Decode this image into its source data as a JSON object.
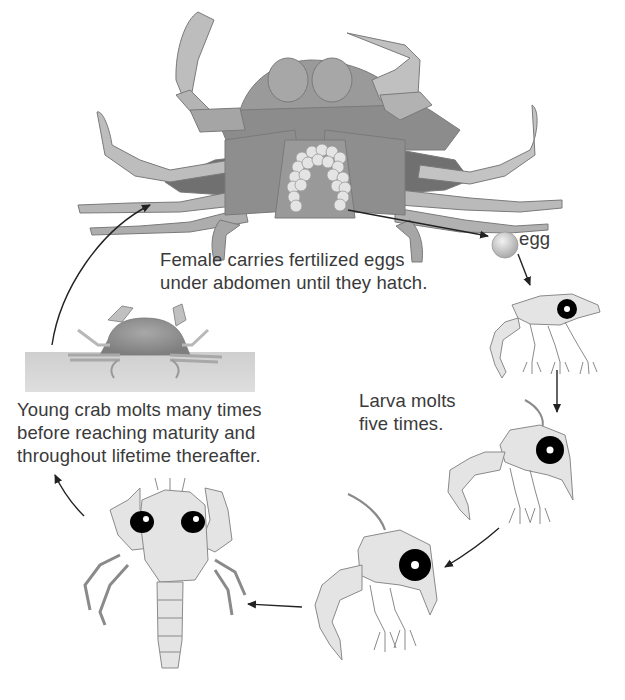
{
  "diagram": {
    "stages": [
      {
        "id": "adult-female",
        "name": "Adult female crab with eggs"
      },
      {
        "id": "egg",
        "name": "egg"
      },
      {
        "id": "larva-1",
        "name": "Larva (zoea), early stage"
      },
      {
        "id": "larva-2",
        "name": "Larva (zoea), later stage"
      },
      {
        "id": "larva-3",
        "name": "Larva (zoea), final stage"
      },
      {
        "id": "megalopa",
        "name": "Postlarva (megalopa)"
      },
      {
        "id": "young-crab",
        "name": "Young crab on sea floor"
      }
    ],
    "labels": {
      "female": [
        "Female carries fertilized eggs",
        "under abdomen until they hatch."
      ],
      "egg": "egg",
      "larva": [
        "Larva molts",
        "five times."
      ],
      "young": [
        "Young crab molts many times",
        "before reaching maturity and",
        "throughout lifetime thereafter."
      ]
    },
    "colors": {
      "crab_body": "#8f8f8f",
      "crab_dark": "#6f6f6f",
      "crab_light": "#c8c8c8",
      "larva_fill": "#e4e4e4",
      "outline": "#7a7a7a",
      "eye": "#000000",
      "ground": "#c9c9c9",
      "arrow": "#222222",
      "text": "#3a3a3a"
    }
  }
}
